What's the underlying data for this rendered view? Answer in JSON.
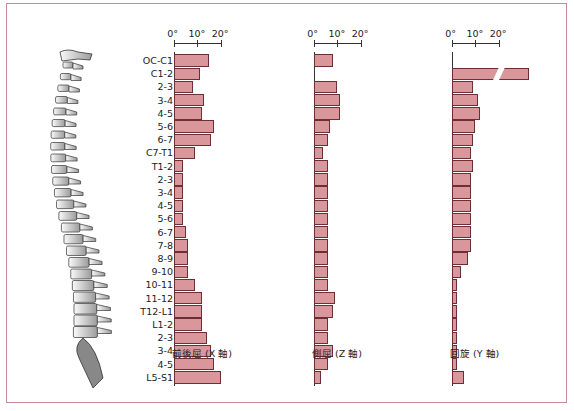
{
  "chart_data": [
    {
      "type": "bar",
      "orientation": "horizontal",
      "title": "前後屈 (X 軸)",
      "xlabel": "前後屈 (X 軸)",
      "unit": "°",
      "xticks": [
        "0°",
        "10°",
        "20°"
      ],
      "xlim": [
        0,
        20
      ],
      "categories": [
        "OC-C1",
        "C1-2",
        "2-3",
        "3-4",
        "4-5",
        "5-6",
        "6-7",
        "C7-T1",
        "T1-2",
        "2-3",
        "3-4",
        "4-5",
        "5-6",
        "6-7",
        "7-8",
        "8-9",
        "9-10",
        "10-11",
        "11-12",
        "T12-L1",
        "L1-2",
        "2-3",
        "3-4",
        "4-5",
        "L5-S1"
      ],
      "values": [
        15,
        11,
        8,
        13,
        12,
        17,
        16,
        9,
        4,
        4,
        4,
        4,
        4,
        5,
        6,
        6,
        6,
        9,
        12,
        12,
        12,
        14,
        16,
        17,
        20
      ]
    },
    {
      "type": "bar",
      "orientation": "horizontal",
      "title": "側屈 (Z 軸)",
      "xlabel": "側屈 (Z 軸)",
      "unit": "°",
      "xticks": [
        "0°",
        "10°",
        "20°"
      ],
      "xlim": [
        0,
        20
      ],
      "categories": [
        "OC-C1",
        "C1-2",
        "2-3",
        "3-4",
        "4-5",
        "5-6",
        "6-7",
        "C7-T1",
        "T1-2",
        "2-3",
        "3-4",
        "4-5",
        "5-6",
        "6-7",
        "7-8",
        "8-9",
        "9-10",
        "10-11",
        "11-12",
        "T12-L1",
        "L1-2",
        "2-3",
        "3-4",
        "4-5",
        "L5-S1"
      ],
      "values": [
        8,
        0,
        10,
        11,
        11,
        7,
        6,
        4,
        6,
        6,
        6,
        6,
        6,
        6,
        6,
        6,
        6,
        6,
        9,
        8,
        6,
        6,
        8,
        6,
        3
      ]
    },
    {
      "type": "bar",
      "orientation": "horizontal",
      "title": "回旋 (Y 軸)",
      "xlabel": "回旋 (Y 軸)",
      "unit": "°",
      "xticks": [
        "0°",
        "10°",
        "20°"
      ],
      "xlim": [
        0,
        20
      ],
      "annotations": [
        "C1-2 bar is broken (axis break) — value exceeds axis range"
      ],
      "categories": [
        "OC-C1",
        "C1-2",
        "2-3",
        "3-4",
        "4-5",
        "5-6",
        "6-7",
        "C7-T1",
        "T1-2",
        "2-3",
        "3-4",
        "4-5",
        "5-6",
        "6-7",
        "7-8",
        "8-9",
        "9-10",
        "10-11",
        "11-12",
        "T12-L1",
        "L1-2",
        "2-3",
        "3-4",
        "4-5",
        "L5-S1"
      ],
      "values": [
        0,
        47,
        9,
        11,
        12,
        10,
        9,
        8,
        9,
        8,
        8,
        8,
        8,
        8,
        8,
        7,
        4,
        2,
        2,
        2,
        2,
        2,
        2,
        2,
        5
      ]
    }
  ],
  "labels": [
    "OC-C1",
    "C1-2",
    "2-3",
    "3-4",
    "4-5",
    "5-6",
    "6-7",
    "C7-T1",
    "T1-2",
    "2-3",
    "3-4",
    "4-5",
    "5-6",
    "6-7",
    "7-8",
    "8-9",
    "9-10",
    "10-11",
    "11-12",
    "T12-L1",
    "L1-2",
    "2-3",
    "3-4",
    "4-5",
    "L5-S1"
  ],
  "panels": [
    {
      "caption": "前後屈 (X 軸)",
      "ticks": [
        "0°",
        "10°",
        "20°"
      ]
    },
    {
      "caption": "側屈 (Z 軸)",
      "ticks": [
        "0°",
        "10°",
        "20°"
      ]
    },
    {
      "caption": "回旋 (Y 軸)",
      "ticks": [
        "0°",
        "10°",
        "20°"
      ]
    }
  ],
  "illustration": {
    "icon": "spine-illustration-icon"
  },
  "colors": {
    "bar_fill": "#d9979c",
    "bar_stroke": "#6d2e35",
    "frame": "#c98a96"
  }
}
